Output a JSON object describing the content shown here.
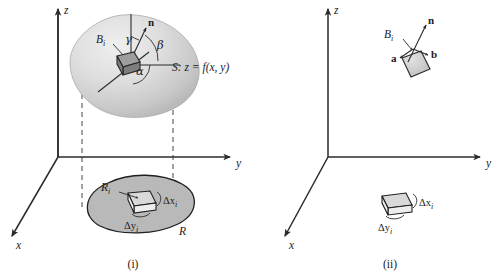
{
  "figure": {
    "caption_i": "(i)",
    "caption_ii": "(ii)",
    "background_color": "#ffffff",
    "ink_color": "#1b1b1b"
  },
  "panel_i": {
    "name": "surface-over-region",
    "axes": {
      "z_label": "z",
      "y_label": "y",
      "x_label": "x"
    },
    "surface": {
      "label": "S: z = f(x, y)",
      "fill_color": "#d8d8d8",
      "patch_label": "B",
      "patch_label_sub": "i"
    },
    "normal": {
      "label": "n"
    },
    "angles": {
      "gamma": "γ",
      "beta": "β",
      "alpha": "α"
    },
    "region": {
      "label": "R",
      "subregion_label": "R",
      "subregion_sub": "i",
      "delta_x": "Δx",
      "delta_x_sub": "i",
      "delta_y": "Δy",
      "delta_y_sub": "i",
      "fill_color": "#b9b9b9"
    }
  },
  "panel_ii": {
    "name": "tangent-parallelogram",
    "axes": {
      "z_label": "z",
      "y_label": "y",
      "x_label": "x"
    },
    "patch": {
      "label": "B",
      "label_sub": "i",
      "vector_a": "a",
      "vector_b": "b",
      "normal": "n",
      "fill_color": "#d0d0d0"
    },
    "tile": {
      "delta_x": "Δx",
      "delta_x_sub": "i",
      "delta_y": "Δy",
      "delta_y_sub": "i",
      "fill_color": "#d9d9d9"
    }
  }
}
